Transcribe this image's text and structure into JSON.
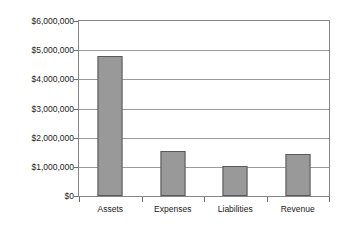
{
  "chart_data": {
    "type": "bar",
    "title": "",
    "subtitle": "",
    "xlabel": "",
    "ylabel": "",
    "categories": [
      "Assets",
      "Expenses",
      "Liabilities",
      "Revenue"
    ],
    "values": [
      4800000,
      1550000,
      1030000,
      1450000
    ],
    "ylim": [
      0,
      6000000
    ],
    "ytick_values": [
      0,
      1000000,
      2000000,
      3000000,
      4000000,
      5000000,
      6000000
    ],
    "ytick_labels": [
      "$0",
      "$1,000,000",
      "$2,000,000",
      "$3,000,000",
      "$4,000,000",
      "$5,000,000",
      "$6,000,000"
    ],
    "grid": true,
    "grid_axis": "y",
    "legend": false,
    "legend_position": "none",
    "series": [
      {
        "name": "",
        "values": [
          4800000,
          1550000,
          1030000,
          1450000
        ]
      }
    ],
    "colors": {
      "bar_fill": "#999999",
      "bar_border": "#595959",
      "gridline": "#9a9a9a",
      "axis": "#868686",
      "tick": "#6b6b6b",
      "text": "#1a1a1a",
      "background": "#ffffff"
    }
  }
}
